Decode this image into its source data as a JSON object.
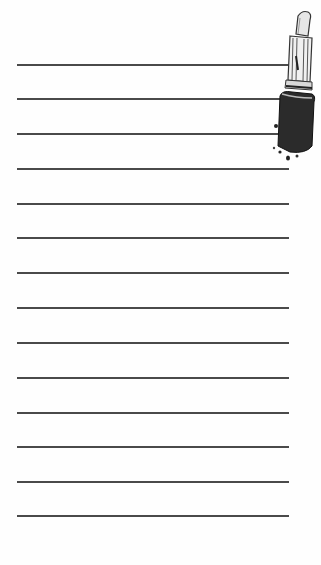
{
  "notepad": {
    "line_count": 14,
    "line_color": "#4a4a4a",
    "background_color": "#ffffff",
    "lines_y": [
      64,
      98,
      133,
      168,
      203,
      237,
      272,
      307,
      342,
      377,
      412,
      446,
      481,
      515
    ]
  },
  "illustration": {
    "icon": "lipstick-icon",
    "body_color": "#2b2b2b"
  }
}
